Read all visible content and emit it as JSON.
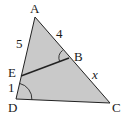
{
  "diagram": {
    "type": "geometry-triangle",
    "colors": {
      "fill": "#c9c9c9",
      "stroke": "#222222",
      "text": "#1a1a1a"
    },
    "vertices": {
      "A": {
        "label": "A",
        "x": 35,
        "y": 17
      },
      "B": {
        "label": "B",
        "x": 69,
        "y": 58
      },
      "C": {
        "label": "C",
        "x": 110,
        "y": 103
      },
      "D": {
        "label": "D",
        "x": 16,
        "y": 99
      },
      "E": {
        "label": "E",
        "x": 21,
        "y": 76
      }
    },
    "segments": [
      {
        "from": "A",
        "to": "D"
      },
      {
        "from": "A",
        "to": "C"
      },
      {
        "from": "D",
        "to": "C"
      },
      {
        "from": "E",
        "to": "B"
      }
    ],
    "side_labels": {
      "AE": "5",
      "ED": "1",
      "AB": "4",
      "BC": "x"
    },
    "angle_marks": [
      {
        "at": "D",
        "between": [
          "A",
          "C"
        ],
        "note": "congruent angle"
      },
      {
        "at": "B",
        "between": [
          "A",
          "E"
        ],
        "note": "congruent angle"
      }
    ]
  }
}
